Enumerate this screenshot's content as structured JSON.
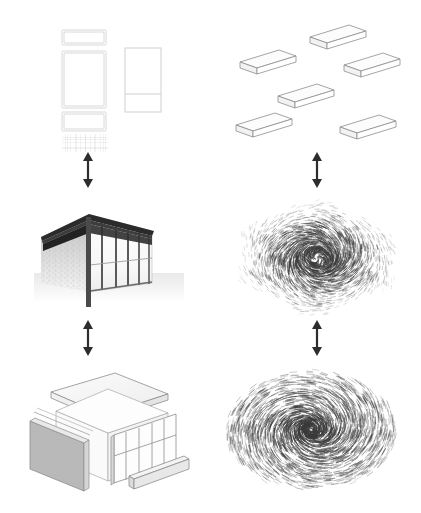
{
  "figure": {
    "background_color": "#ffffff",
    "columns": [
      {
        "id": "left",
        "label": "Concrete architectural representations"
      },
      {
        "id": "right",
        "label": "Abstract geometric / vector-field counterparts"
      }
    ],
    "rows": [
      {
        "id": "top",
        "label": "Orthographic drawings / floating slabs"
      },
      {
        "id": "middle",
        "label": "Perspective render / dense vector volume"
      },
      {
        "id": "bottom",
        "label": "Exploded axonometric / swirling vector field"
      }
    ]
  },
  "panels": {
    "top_left": {
      "name": "orthographic-drawing-set",
      "caption": "Plan and elevation line drawings with hatched ground grid",
      "stroke_color": "#d8d8d8",
      "elements": [
        {
          "type": "rect",
          "role": "roof-plan-strip"
        },
        {
          "type": "rect",
          "role": "floor-plan"
        },
        {
          "type": "rect",
          "role": "section-strip"
        },
        {
          "type": "rect",
          "role": "elevation"
        },
        {
          "type": "hatch",
          "role": "site-grid-hatch"
        }
      ]
    },
    "top_right": {
      "name": "floating-slab-array",
      "caption": "Six thin isometric slabs scattered in space",
      "stroke_color": "#8d8d8d",
      "slab_count": 6
    },
    "middle_left": {
      "name": "perspective-render",
      "caption": "Perspective render of a pavilion: dark roof plane, textured stone wall, glazed facade with mullions",
      "roof_color": "#2b2b2b",
      "wall_color": "#cccccc",
      "mullion_color": "#555555"
    },
    "middle_right": {
      "name": "dense-vector-volume",
      "caption": "Dense hatched vector field forming a cube-like volume",
      "ink_color": "#3a3a3a"
    },
    "bottom_left": {
      "name": "exploded-axonometric",
      "caption": "Exploded axonometric: roof slab, gray wall panel, glazed frame, sill beam",
      "stroke_color": "#8d8d8d",
      "panel_fill": "#b9b9b9"
    },
    "bottom_right": {
      "name": "swirling-vector-field",
      "caption": "Swirling vector field of short dashes around a vortex center",
      "ink_color": "#3a3a3a"
    }
  },
  "arrows": {
    "color": "#2d2d2d",
    "items": [
      {
        "name": "arrow-top-left-to-middle-left",
        "direction": "bidirectional",
        "orientation": "vertical"
      },
      {
        "name": "arrow-top-right-to-middle-right",
        "direction": "bidirectional",
        "orientation": "vertical"
      },
      {
        "name": "arrow-middle-left-to-bottom-left",
        "direction": "bidirectional",
        "orientation": "vertical"
      },
      {
        "name": "arrow-middle-right-to-bottom-right",
        "direction": "bidirectional",
        "orientation": "vertical"
      }
    ]
  }
}
